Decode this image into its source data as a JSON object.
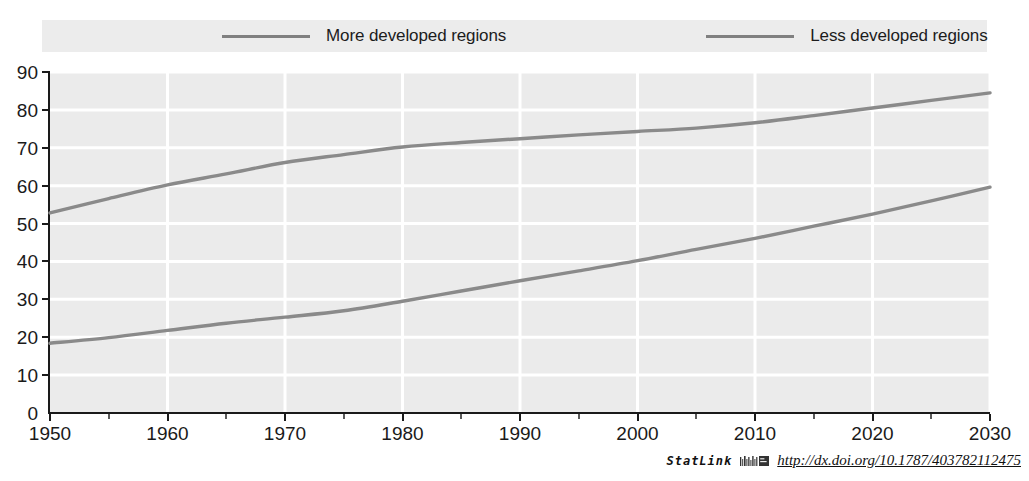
{
  "legend": {
    "position": "top",
    "entries": [
      {
        "label": "More developed regions",
        "color": "#8a8a8a",
        "icon": "line-swatch"
      },
      {
        "label": "Less developed regions",
        "color": "#8a8a8a",
        "icon": "line-swatch"
      }
    ]
  },
  "axes": {
    "y_ticks": [
      "0",
      "10",
      "20",
      "30",
      "40",
      "50",
      "60",
      "70",
      "80",
      "90"
    ],
    "x_ticks": [
      "1950",
      "1960",
      "1970",
      "1980",
      "1990",
      "2000",
      "2010",
      "2020",
      "2030"
    ]
  },
  "footer": {
    "statlink_word": "StatLink",
    "statlink_icon": "statlink-barcode-icon",
    "url": "http://dx.doi.org/10.1787/403782112475"
  },
  "colors": {
    "plot_background": "#ebebeb",
    "legend_background": "#ececec",
    "gridline": "#ffffff",
    "axis": "#1a1a1a",
    "series_line": "#8a8a8a",
    "page_background": "#ffffff"
  },
  "chart_data": {
    "type": "line",
    "title": "",
    "subtitle": "",
    "xlabel": "",
    "ylabel": "",
    "xlim": [
      1950,
      2030
    ],
    "ylim": [
      0,
      90
    ],
    "xticks": [
      1950,
      1960,
      1970,
      1980,
      1990,
      2000,
      2010,
      2020,
      2030
    ],
    "yticks": [
      0,
      10,
      20,
      30,
      40,
      50,
      60,
      70,
      80,
      90
    ],
    "grid": true,
    "legend_position": "top",
    "x": [
      1950,
      1955,
      1960,
      1965,
      1970,
      1975,
      1980,
      1985,
      1990,
      1995,
      2000,
      2005,
      2010,
      2015,
      2020,
      2025,
      2030
    ],
    "series": [
      {
        "name": "More developed regions",
        "color": "#8a8a8a",
        "values": [
          52.8,
          56.6,
          60.2,
          63.1,
          66.1,
          68.2,
          70.2,
          71.4,
          72.4,
          73.4,
          74.3,
          75.2,
          76.6,
          78.5,
          80.5,
          82.5,
          84.5
        ]
      },
      {
        "name": "Less developed regions",
        "color": "#8a8a8a",
        "values": [
          18.4,
          19.9,
          21.8,
          23.7,
          25.3,
          27.0,
          29.5,
          32.2,
          34.9,
          37.5,
          40.2,
          43.2,
          46.1,
          49.3,
          52.5,
          56.0,
          59.6
        ]
      }
    ]
  }
}
